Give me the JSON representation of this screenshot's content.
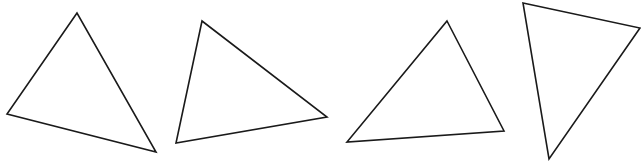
{
  "figure": {
    "width": 641,
    "height": 165,
    "background": "#ffffff",
    "stroke_color": "#1a1a1a",
    "stroke_width": 1.6
  },
  "triangles": [
    {
      "name": "triangle-1",
      "points": [
        [
          77,
          13
        ],
        [
          7,
          114
        ],
        [
          156,
          152
        ]
      ]
    },
    {
      "name": "triangle-2",
      "points": [
        [
          202,
          21
        ],
        [
          327,
          117
        ],
        [
          176,
          143
        ]
      ]
    },
    {
      "name": "triangle-3",
      "points": [
        [
          447,
          21
        ],
        [
          504,
          131
        ],
        [
          347,
          142
        ]
      ]
    },
    {
      "name": "triangle-4",
      "points": [
        [
          523,
          3
        ],
        [
          640,
          28
        ],
        [
          549,
          159
        ]
      ]
    }
  ]
}
